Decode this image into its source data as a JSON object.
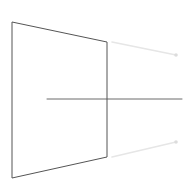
{
  "canvas": {
    "width": 194,
    "height": 183,
    "background_color": "#ffffff",
    "title": "",
    "description": "Perspective line drawing: a trapezoid panel with a horizontal axis line and two faint receding guide lines with endpoint markers"
  },
  "palette": {
    "panel_stroke": "#555555",
    "axis_stroke": "#6b6b6b",
    "guide_stroke": "#e6e6e6",
    "marker_fill": "#dcdcdc",
    "background": "#ffffff"
  },
  "shapes": {
    "panel": {
      "name": "trapezoid-panel",
      "stroke_color": "#555555",
      "stroke_width": 1,
      "fill": "none",
      "points": "12,22 107,42 107,157 12,178",
      "vertices": [
        {
          "label": "top-left",
          "x": 12,
          "y": 22
        },
        {
          "label": "top-right",
          "x": 107,
          "y": 42
        },
        {
          "label": "bottom-right",
          "x": 107,
          "y": 157
        },
        {
          "label": "bottom-left",
          "x": 12,
          "y": 178
        }
      ]
    },
    "axis_line": {
      "name": "horizontal-axis-line",
      "stroke_color": "#6b6b6b",
      "stroke_width": 1,
      "x1": 47,
      "y1": 99,
      "x2": 182,
      "y2": 99
    },
    "guide_lines": [
      {
        "name": "upper-guide-line",
        "stroke_color": "#e6e6e6",
        "stroke_width": 1.6,
        "x1": 112,
        "y1": 42,
        "x2": 176,
        "y2": 55
      },
      {
        "name": "lower-guide-line",
        "stroke_color": "#e6e6e6",
        "stroke_width": 1.6,
        "x1": 112,
        "y1": 157,
        "x2": 176,
        "y2": 142
      }
    ],
    "markers": [
      {
        "name": "upper-guide-endpoint-marker",
        "fill": "#dcdcdc",
        "cx": 176,
        "cy": 55,
        "r": 1.8
      },
      {
        "name": "lower-guide-endpoint-marker",
        "fill": "#dcdcdc",
        "cx": 176,
        "cy": 142,
        "r": 1.8
      }
    ]
  }
}
